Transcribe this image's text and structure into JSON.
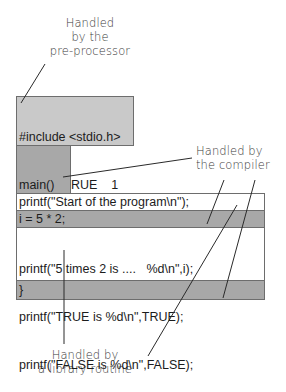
{
  "labels": {
    "preprocessor": [
      "Handled",
      "by the",
      "pre-processor"
    ],
    "compiler": [
      "Handled by",
      "the compiler"
    ],
    "library": [
      "Handled by",
      "a library routine"
    ]
  },
  "code": {
    "preprocessor_lines": [
      "#include <stdio.h>",
      "#define TRUE    1",
      "#define FALSE   0"
    ],
    "main_lines": [
      "main()",
      "{",
      "int i;"
    ],
    "printf_start": "printf(\"Start of the program\\n\");",
    "assign": "i = 5 * 2;",
    "printf_lines": [
      "printf(\"5 times 2 is ....   %d\\n\",i);",
      "printf(\"TRUE is %d\\n\",TRUE);",
      "printf(\"FALSE is %d\\n\",FALSE);"
    ],
    "close": "}"
  },
  "colors": {
    "light_gray": "#c9c9c9",
    "dark_gray": "#a8a8a8",
    "white": "#ffffff",
    "border": "#6d6d6d"
  }
}
